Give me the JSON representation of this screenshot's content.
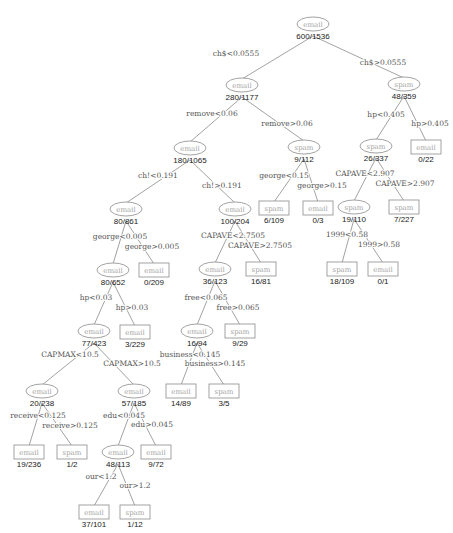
{
  "nodes": [
    {
      "id": "n0",
      "type": "split",
      "class": "email",
      "count": "600/1536",
      "x": 313,
      "y": 24
    },
    {
      "id": "n1",
      "type": "split",
      "class": "email",
      "count": "280/1177",
      "x": 242,
      "y": 85
    },
    {
      "id": "n2",
      "type": "split",
      "class": "spam",
      "count": "48/359",
      "x": 404,
      "y": 84
    },
    {
      "id": "n3",
      "type": "split",
      "class": "email",
      "count": "180/1065",
      "x": 190,
      "y": 148
    },
    {
      "id": "n4",
      "type": "split",
      "class": "spam",
      "count": "9/112",
      "x": 304,
      "y": 147
    },
    {
      "id": "n5",
      "type": "leaf",
      "class": "email",
      "count": "0/22",
      "x": 426,
      "y": 147
    },
    {
      "id": "n6",
      "type": "split",
      "class": "spam",
      "count": "26/337",
      "x": 376,
      "y": 146
    },
    {
      "id": "n7",
      "type": "split",
      "class": "email",
      "count": "80/861",
      "x": 126,
      "y": 209
    },
    {
      "id": "n8",
      "type": "split",
      "class": "email",
      "count": "100/204",
      "x": 235,
      "y": 209
    },
    {
      "id": "n9",
      "type": "leaf",
      "class": "spam",
      "count": "6/109",
      "x": 274,
      "y": 208
    },
    {
      "id": "n10",
      "type": "leaf",
      "class": "email",
      "count": "0/3",
      "x": 318,
      "y": 208
    },
    {
      "id": "n11",
      "type": "split",
      "class": "spam",
      "count": "19/110",
      "x": 354,
      "y": 207
    },
    {
      "id": "n12",
      "type": "leaf",
      "class": "spam",
      "count": "7/227",
      "x": 404,
      "y": 207
    },
    {
      "id": "n13",
      "type": "split",
      "class": "email",
      "count": "80/652",
      "x": 113,
      "y": 270
    },
    {
      "id": "n14",
      "type": "leaf",
      "class": "email",
      "count": "0/209",
      "x": 154,
      "y": 270
    },
    {
      "id": "n15",
      "type": "split",
      "class": "email",
      "count": "36/123",
      "x": 215,
      "y": 269
    },
    {
      "id": "n16",
      "type": "leaf",
      "class": "spam",
      "count": "16/81",
      "x": 261,
      "y": 269
    },
    {
      "id": "n17",
      "type": "leaf",
      "class": "spam",
      "count": "18/109",
      "x": 342,
      "y": 269
    },
    {
      "id": "n18",
      "type": "leaf",
      "class": "email",
      "count": "0/1",
      "x": 383,
      "y": 269
    },
    {
      "id": "n19",
      "type": "split",
      "class": "email",
      "count": "77/423",
      "x": 94,
      "y": 331
    },
    {
      "id": "n20",
      "type": "leaf",
      "class": "email",
      "count": "3/229",
      "x": 135,
      "y": 332
    },
    {
      "id": "n21",
      "type": "split",
      "class": "email",
      "count": "16/94",
      "x": 197,
      "y": 331
    },
    {
      "id": "n22",
      "type": "leaf",
      "class": "spam",
      "count": "9/29",
      "x": 240,
      "y": 331
    },
    {
      "id": "n23",
      "type": "split",
      "class": "email",
      "count": "20/238",
      "x": 42,
      "y": 391
    },
    {
      "id": "n24",
      "type": "split",
      "class": "email",
      "count": "57/185",
      "x": 134,
      "y": 391
    },
    {
      "id": "n25",
      "type": "leaf",
      "class": "email",
      "count": "14/89",
      "x": 181,
      "y": 391
    },
    {
      "id": "n26",
      "type": "leaf",
      "class": "spam",
      "count": "3/5",
      "x": 224,
      "y": 391
    },
    {
      "id": "n27",
      "type": "leaf",
      "class": "email",
      "count": "19/236",
      "x": 29,
      "y": 452
    },
    {
      "id": "n28",
      "type": "leaf",
      "class": "spam",
      "count": "1/2",
      "x": 72,
      "y": 452
    },
    {
      "id": "n29",
      "type": "split",
      "class": "email",
      "count": "48/113",
      "x": 118,
      "y": 452
    },
    {
      "id": "n30",
      "type": "leaf",
      "class": "email",
      "count": "9/72",
      "x": 156,
      "y": 452
    },
    {
      "id": "n31",
      "type": "leaf",
      "class": "email",
      "count": "37/101",
      "x": 94,
      "y": 512
    },
    {
      "id": "n32",
      "type": "leaf",
      "class": "spam",
      "count": "1/12",
      "x": 135,
      "y": 512
    }
  ],
  "edges": [
    {
      "from": "n0",
      "to": "n1",
      "label": "ch$<0.0555",
      "lx": 236,
      "ly": 56,
      "anchor": "middle"
    },
    {
      "from": "n0",
      "to": "n2",
      "label": "ch$>0.0555",
      "lx": 383,
      "ly": 65,
      "anchor": "middle"
    },
    {
      "from": "n1",
      "to": "n3",
      "label": "remove<0.06",
      "lx": 212,
      "ly": 116,
      "anchor": "middle"
    },
    {
      "from": "n1",
      "to": "n4",
      "label": "remove>0.06",
      "lx": 287,
      "ly": 126,
      "anchor": "middle"
    },
    {
      "from": "n2",
      "to": "n6",
      "label": "hp<0.405",
      "lx": 386,
      "ly": 117,
      "anchor": "middle"
    },
    {
      "from": "n2",
      "to": "n5",
      "label": "hp>0.405",
      "lx": 430,
      "ly": 126,
      "anchor": "middle"
    },
    {
      "from": "n3",
      "to": "n7",
      "label": "ch!<0.191",
      "lx": 158,
      "ly": 178,
      "anchor": "middle"
    },
    {
      "from": "n3",
      "to": "n8",
      "label": "ch!>0.191",
      "lx": 222,
      "ly": 188,
      "anchor": "middle"
    },
    {
      "from": "n4",
      "to": "n9",
      "label": "george<0.15",
      "lx": 284,
      "ly": 178,
      "anchor": "middle"
    },
    {
      "from": "n4",
      "to": "n10",
      "label": "george>0.15",
      "lx": 322,
      "ly": 188,
      "anchor": "middle"
    },
    {
      "from": "n6",
      "to": "n11",
      "label": "CAPAVE<2.907",
      "lx": 365,
      "ly": 176,
      "anchor": "middle"
    },
    {
      "from": "n6",
      "to": "n12",
      "label": "CAPAVE>2.907",
      "lx": 405,
      "ly": 186,
      "anchor": "middle"
    },
    {
      "from": "n7",
      "to": "n13",
      "label": "george<0.005",
      "lx": 120,
      "ly": 239,
      "anchor": "middle"
    },
    {
      "from": "n7",
      "to": "n14",
      "label": "george>0.005",
      "lx": 152,
      "ly": 249,
      "anchor": "middle"
    },
    {
      "from": "n8",
      "to": "n15",
      "label": "CAPAVE<2.7505",
      "lx": 233,
      "ly": 238,
      "anchor": "middle"
    },
    {
      "from": "n8",
      "to": "n16",
      "label": "CAPAVE>2.7505",
      "lx": 260,
      "ly": 248,
      "anchor": "middle"
    },
    {
      "from": "n11",
      "to": "n17",
      "label": "1999<0.58",
      "lx": 347,
      "ly": 237,
      "anchor": "middle"
    },
    {
      "from": "n11",
      "to": "n18",
      "label": "1999>0.58",
      "lx": 379,
      "ly": 247,
      "anchor": "middle"
    },
    {
      "from": "n13",
      "to": "n19",
      "label": "hp<0.03",
      "lx": 96,
      "ly": 300,
      "anchor": "middle"
    },
    {
      "from": "n13",
      "to": "n20",
      "label": "hp>0.03",
      "lx": 132,
      "ly": 310,
      "anchor": "middle"
    },
    {
      "from": "n15",
      "to": "n21",
      "label": "free<0.065",
      "lx": 206,
      "ly": 300,
      "anchor": "middle"
    },
    {
      "from": "n15",
      "to": "n22",
      "label": "free>0.065",
      "lx": 238,
      "ly": 310,
      "anchor": "middle"
    },
    {
      "from": "n19",
      "to": "n23",
      "label": "CAPMAX<10.5",
      "lx": 70,
      "ly": 357,
      "anchor": "middle"
    },
    {
      "from": "n19",
      "to": "n24",
      "label": "CAPMAX>10.5",
      "lx": 132,
      "ly": 366,
      "anchor": "middle"
    },
    {
      "from": "n21",
      "to": "n25",
      "label": "business<0.145",
      "lx": 190,
      "ly": 357,
      "anchor": "middle"
    },
    {
      "from": "n21",
      "to": "n26",
      "label": "business>0.145",
      "lx": 215,
      "ly": 366,
      "anchor": "middle"
    },
    {
      "from": "n23",
      "to": "n27",
      "label": "receive<0.125",
      "lx": 38,
      "ly": 418,
      "anchor": "middle"
    },
    {
      "from": "n23",
      "to": "n28",
      "label": "receive>0.125",
      "lx": 70,
      "ly": 428,
      "anchor": "middle"
    },
    {
      "from": "n24",
      "to": "n29",
      "label": "edu<0.045",
      "lx": 124,
      "ly": 418,
      "anchor": "middle"
    },
    {
      "from": "n24",
      "to": "n30",
      "label": "edu>0.045",
      "lx": 152,
      "ly": 427,
      "anchor": "middle"
    },
    {
      "from": "n29",
      "to": "n31",
      "label": "our<1.2",
      "lx": 101,
      "ly": 479,
      "anchor": "middle"
    },
    {
      "from": "n29",
      "to": "n32",
      "label": "our>1.2",
      "lx": 135,
      "ly": 488,
      "anchor": "middle"
    }
  ],
  "colors": {
    "edge": "#8a8a8a",
    "node_border": "#8c8c8c",
    "class_text": "#a6a6a6",
    "count_text": "#1a1a1a",
    "split_text": "#555555"
  }
}
